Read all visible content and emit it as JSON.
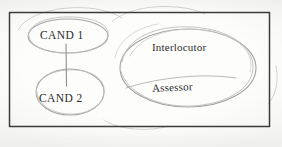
{
  "diagram": {
    "medium": "hand-drawn pencil sketch on paper",
    "frame": {
      "name": "outer-rectangle",
      "x": 9,
      "y": 12,
      "width": 261,
      "height": 115,
      "stroke_color": "#3a3a3a"
    },
    "pencil_stroke_color": "#9a9a9a",
    "ink_text_color": "#2b2b2b",
    "paper_color": "#fdfdfc",
    "nodes": [
      {
        "id": "cand1",
        "label": "CAND 1",
        "shape": "ellipse",
        "cx": 68,
        "cy": 36,
        "rx": 40,
        "ry": 17
      },
      {
        "id": "cand2",
        "label": "CAND 2",
        "shape": "ellipse",
        "cx": 70,
        "cy": 92,
        "rx": 34,
        "ry": 23
      },
      {
        "id": "panel",
        "label": "",
        "shape": "ellipse",
        "cx": 188,
        "cy": 68,
        "rx": 68,
        "ry": 39
      }
    ],
    "panel_labels": [
      {
        "id": "interlocutor",
        "label": "Interlocutor"
      },
      {
        "id": "assessor",
        "label": "Assessor"
      }
    ],
    "connectors": [
      {
        "id": "cand1-cand2-link",
        "from": "cand1",
        "to": "cand2",
        "type": "line",
        "x": 66,
        "y1": 44,
        "y2": 86
      }
    ]
  }
}
